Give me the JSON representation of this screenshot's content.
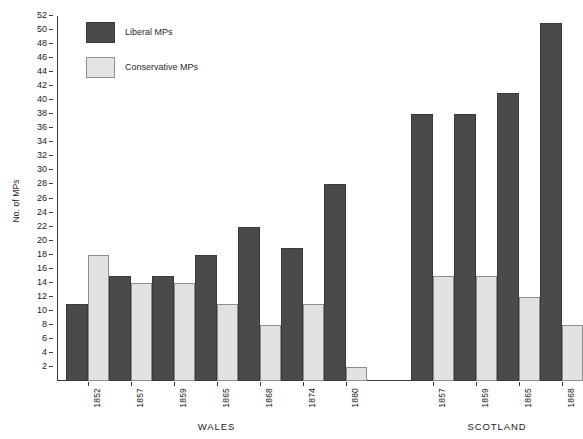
{
  "chart_data": {
    "type": "bar",
    "title": "",
    "xlabel": "",
    "ylabel": "No. of MPs",
    "ylim": [
      0,
      52
    ],
    "ytick_step": 2,
    "grid": false,
    "legend_position": "top-left",
    "yticks": [
      2,
      4,
      6,
      8,
      10,
      12,
      14,
      16,
      18,
      20,
      22,
      24,
      26,
      28,
      30,
      32,
      34,
      36,
      38,
      40,
      42,
      44,
      46,
      48,
      50,
      52
    ],
    "legend": [
      {
        "name": "Liberal MPs",
        "color": "#4a4a4a"
      },
      {
        "name": "Conservative MPs",
        "color": "#e2e2e2"
      }
    ],
    "series": [
      {
        "name": "Liberal MPs",
        "values": [
          11,
          15,
          15,
          18,
          22,
          19,
          28,
          38,
          38,
          41,
          51
        ]
      },
      {
        "name": "Conservative MPs",
        "values": [
          18,
          14,
          14,
          11,
          8,
          11,
          2,
          15,
          15,
          12,
          8
        ]
      }
    ],
    "categories": [
      "1852",
      "1857",
      "1859",
      "1865",
      "1868",
      "1874",
      "1880",
      "1857",
      "1859",
      "1865",
      "1868"
    ],
    "groups": [
      {
        "label": "WALES",
        "categories": [
          "1852",
          "1857",
          "1859",
          "1865",
          "1868",
          "1874",
          "1880"
        ]
      },
      {
        "label": "SCOTLAND",
        "categories": [
          "1857",
          "1859",
          "1865",
          "1868"
        ]
      }
    ],
    "annotations": []
  }
}
